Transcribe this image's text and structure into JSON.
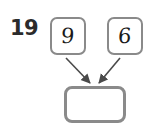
{
  "problem": {
    "number": "19",
    "type": "addition-arrow-diagram",
    "operand_left": "9",
    "operand_right": "6",
    "answer": "",
    "answer_placeholder": ""
  },
  "colors": {
    "background": "#ffffff",
    "box_border": "#8a8a8a",
    "digit": "#1a1a1a",
    "number_label": "#2b2b2b",
    "arrow": "#4a4a4a"
  },
  "arrows": [
    {
      "name": "arrow-left-to-answer",
      "from": "operand-box-left",
      "to": "answer-box"
    },
    {
      "name": "arrow-right-to-answer",
      "from": "operand-box-right",
      "to": "answer-box"
    }
  ]
}
